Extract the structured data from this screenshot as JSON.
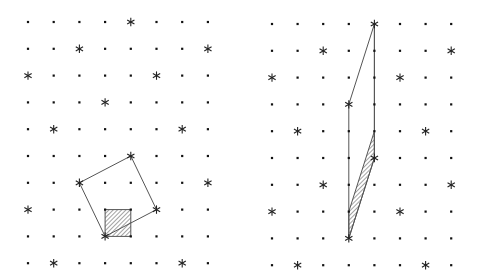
{
  "figure": {
    "width": 479,
    "height": 277,
    "background": "#ffffff",
    "colors": {
      "dot": "#111111",
      "star": "#222222",
      "line": "#555555",
      "hatch": "#333333"
    }
  },
  "panels": [
    {
      "name": "left-panel",
      "origin": [
        28,
        22
      ],
      "step": [
        25.7,
        26.8
      ],
      "cols": 8,
      "rows": 10,
      "stars": [
        [
          4,
          0
        ],
        [
          2,
          1
        ],
        [
          7,
          1
        ],
        [
          0,
          2
        ],
        [
          5,
          2
        ],
        [
          3,
          3
        ],
        [
          1,
          4
        ],
        [
          6,
          4
        ],
        [
          4,
          5
        ],
        [
          2,
          6
        ],
        [
          7,
          6
        ],
        [
          0,
          7
        ],
        [
          5,
          7
        ],
        [
          3,
          8
        ],
        [
          1,
          9
        ],
        [
          6,
          9
        ]
      ],
      "outline_polygons": [
        {
          "name": "tilted-square",
          "points": [
            [
              4,
              5
            ],
            [
              2,
              6
            ],
            [
              3,
              8
            ],
            [
              5,
              7
            ]
          ]
        }
      ],
      "extra_lines": [],
      "hatched_polygons": [
        {
          "name": "hatched-unit-square",
          "points": [
            [
              3,
              7
            ],
            [
              4,
              7
            ],
            [
              4,
              8
            ],
            [
              3,
              8
            ]
          ]
        }
      ]
    },
    {
      "name": "right-panel",
      "origin": [
        272,
        24
      ],
      "step": [
        25.6,
        26.8
      ],
      "cols": 8,
      "rows": 10,
      "stars": [
        [
          4,
          0
        ],
        [
          2,
          1
        ],
        [
          7,
          1
        ],
        [
          0,
          2
        ],
        [
          5,
          2
        ],
        [
          3,
          3
        ],
        [
          1,
          4
        ],
        [
          6,
          4
        ],
        [
          4,
          5
        ],
        [
          2,
          6
        ],
        [
          7,
          6
        ],
        [
          0,
          7
        ],
        [
          5,
          7
        ],
        [
          3,
          8
        ],
        [
          1,
          9
        ],
        [
          6,
          9
        ]
      ],
      "outline_polygons": [
        {
          "name": "outer-parallelogram",
          "points": [
            [
              4,
              0
            ],
            [
              3,
              3
            ],
            [
              3,
              8
            ],
            [
              4,
              5
            ]
          ]
        }
      ],
      "extra_lines": [
        {
          "name": "vertical-edge-col4",
          "from": [
            4,
            0
          ],
          "to": [
            4,
            5
          ]
        }
      ],
      "hatched_polygons": [
        {
          "name": "hatched-parallelogram",
          "points": [
            [
              4,
              4
            ],
            [
              4,
              5
            ],
            [
              3,
              8
            ],
            [
              3,
              7
            ]
          ]
        }
      ]
    }
  ]
}
